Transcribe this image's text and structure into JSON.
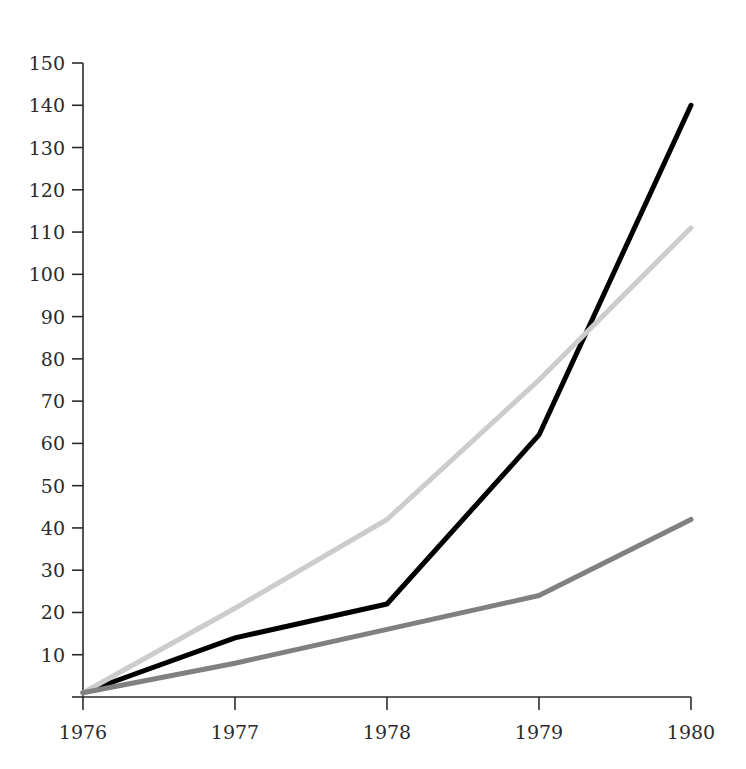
{
  "chart_data": {
    "type": "line",
    "title": "",
    "subtitle": "",
    "xlabel": "",
    "ylabel": "",
    "categories": [
      "1976",
      "1977",
      "1978",
      "1979",
      "1980"
    ],
    "x": [
      1976,
      1977,
      1978,
      1979,
      1980
    ],
    "xlim": [
      1976,
      1980
    ],
    "ylim": [
      0,
      150
    ],
    "grid": false,
    "legend": "none",
    "y_ticks": [
      0,
      10,
      20,
      30,
      40,
      50,
      60,
      70,
      80,
      90,
      100,
      110,
      120,
      130,
      140,
      150
    ],
    "y_tick_labels": [
      "",
      "10",
      "20",
      "30",
      "40",
      "50",
      "60",
      "70",
      "80",
      "90",
      "100",
      "110",
      "120",
      "130",
      "140",
      "150"
    ],
    "x_ticks": [
      1976,
      1977,
      1978,
      1979,
      1980
    ],
    "x_tick_labels": [
      "1976",
      "1977",
      "1978",
      "1979",
      "1980"
    ],
    "series": [
      {
        "name": "series-dark",
        "color": "#000000",
        "width": 5,
        "values": [
          1,
          14,
          22,
          62,
          140
        ]
      },
      {
        "name": "series-light-gray",
        "color": "#cccccc",
        "width": 5,
        "values": [
          1,
          21,
          42,
          75,
          111
        ]
      },
      {
        "name": "series-medium-gray",
        "color": "#808080",
        "width": 5,
        "values": [
          1,
          8,
          16,
          24,
          42
        ]
      }
    ]
  },
  "axes": {
    "y_axis_name": "y-axis",
    "x_axis_name": "x-axis"
  },
  "colors": {
    "background": "#ffffff",
    "axis": "#2b2b2b",
    "text": "#2b2b2b",
    "series_dark": "#000000",
    "series_light_gray": "#cccccc",
    "series_medium_gray": "#808080"
  }
}
